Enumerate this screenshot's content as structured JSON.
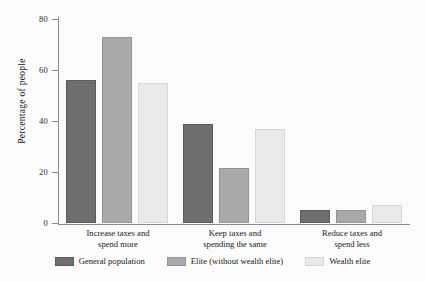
{
  "chart_data": {
    "type": "bar",
    "title": "",
    "subtitle": "",
    "xlabel": "",
    "ylabel": "Percentage of people",
    "ylim": [
      0,
      80
    ],
    "yticks": [
      0,
      20,
      40,
      60,
      80
    ],
    "ytick_labels": [
      "0",
      "20",
      "40",
      "60",
      "80"
    ],
    "grid": false,
    "legend_position": "bottom",
    "categories": [
      "Increase taxes and spend more",
      "Keep taxes and spending the same",
      "Reduce taxes and spend less"
    ],
    "category_lines": [
      [
        "Increase taxes and",
        "spend more"
      ],
      [
        "Keep taxes and",
        "spending the same"
      ],
      [
        "Reduce taxes and",
        "spend less"
      ]
    ],
    "series": [
      {
        "name": "General population",
        "color": "#6e6e6e",
        "border": "#5a5a5a",
        "values": [
          56,
          39,
          5
        ]
      },
      {
        "name": "Elite (without wealth elite)",
        "color": "#a9a9a9",
        "border": "#949494",
        "values": [
          73,
          21.5,
          5
        ]
      },
      {
        "name": "Wealth elite",
        "color": "#e9e9e9",
        "border": "#d6d6d6",
        "values": [
          55,
          37,
          7
        ]
      }
    ]
  },
  "axis": {
    "y_title": "Percentage of people",
    "tick_80": "80",
    "tick_60": "60",
    "tick_40": "40",
    "tick_20": "20",
    "tick_0": "0"
  },
  "xlabels": {
    "g0_l0": "Increase taxes and",
    "g0_l1": "spend more",
    "g1_l0": "Keep taxes and",
    "g1_l1": "spending the same",
    "g2_l0": "Reduce taxes and",
    "g2_l1": "spend less"
  },
  "legend": {
    "items": [
      {
        "label": "General population"
      },
      {
        "label": "Elite (without wealth elite)"
      },
      {
        "label": "Wealth elite"
      }
    ]
  }
}
